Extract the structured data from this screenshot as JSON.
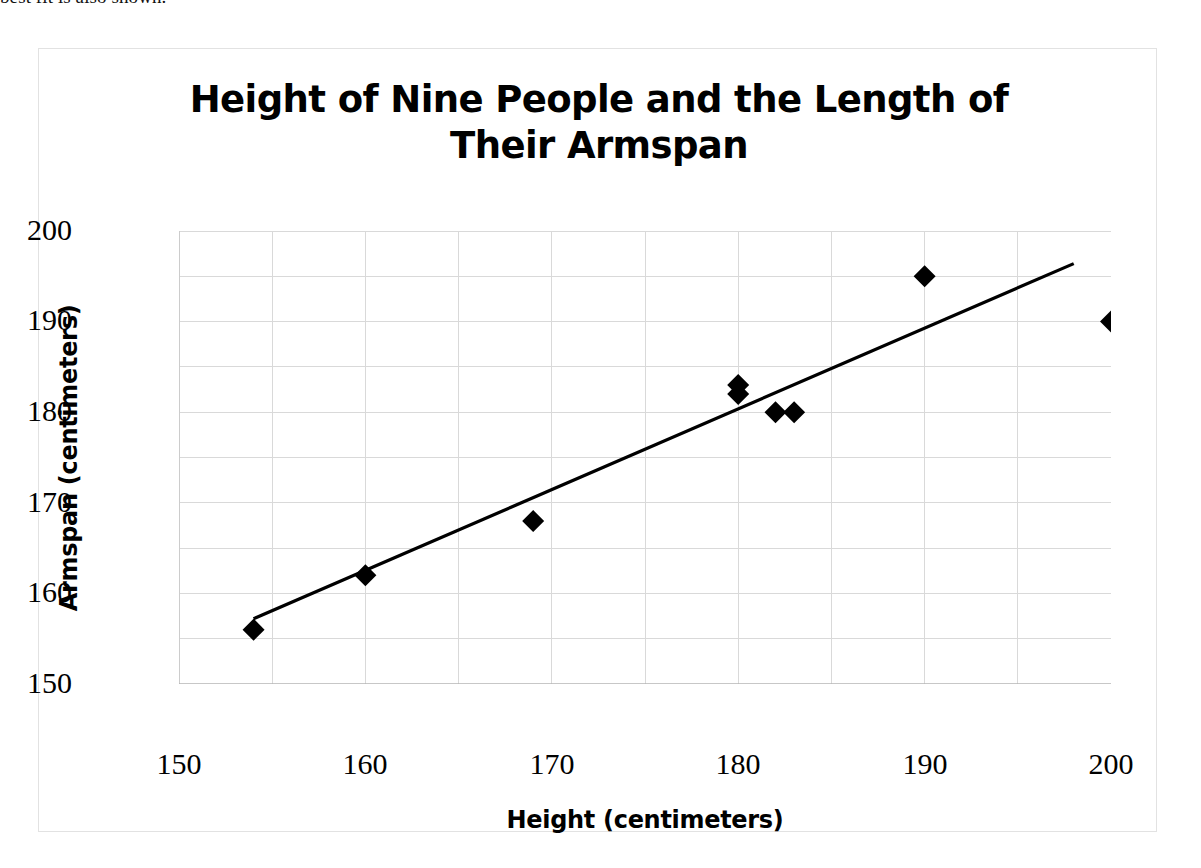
{
  "caption": {
    "text": "best fit is also shown."
  },
  "chart_data": {
    "type": "scatter",
    "title": "Height of Nine People and the Length of Their Armspan",
    "title_lines": [
      "Height of Nine People and the Length of",
      "Their Armspan"
    ],
    "xlabel": "Height (centimeters)",
    "ylabel": "Armspan (centimeters)",
    "xlim": [
      150,
      200
    ],
    "ylim": [
      150,
      200
    ],
    "xticks": [
      150,
      160,
      170,
      180,
      190,
      200
    ],
    "yticks": [
      150,
      160,
      170,
      180,
      190,
      200
    ],
    "xtick_labels": [
      "150",
      "160",
      "170",
      "180",
      "190",
      "200"
    ],
    "ytick_labels": [
      "150",
      "160",
      "170",
      "180",
      "190",
      "200"
    ],
    "grid": true,
    "grid_minor_step": 5,
    "grid_color": "#d9d9d9",
    "legend": false,
    "marker": "diamond",
    "marker_color": "#000000",
    "x": [
      154,
      160,
      169,
      180,
      180,
      182,
      183,
      190,
      200
    ],
    "y": [
      156,
      162,
      168,
      183,
      182,
      180,
      180,
      195,
      190
    ],
    "points": [
      {
        "x": 154,
        "y": 156
      },
      {
        "x": 160,
        "y": 162
      },
      {
        "x": 169,
        "y": 168
      },
      {
        "x": 180,
        "y": 183
      },
      {
        "x": 180,
        "y": 182
      },
      {
        "x": 182,
        "y": 180
      },
      {
        "x": 183,
        "y": 180
      },
      {
        "x": 190,
        "y": 195
      },
      {
        "x": 200,
        "y": 190
      }
    ],
    "trendline": {
      "label": "line of best fit",
      "color": "#000000",
      "x_start": 154,
      "y_start": 157.2,
      "x_end": 198,
      "y_end": 196.4
    }
  }
}
